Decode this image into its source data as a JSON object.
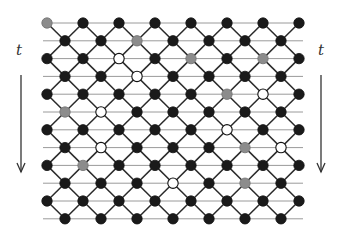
{
  "diagram": {
    "time_label": "t",
    "colors": {
      "black": "#1a1a1a",
      "gray": "#8c8c8c",
      "white": "#ffffff",
      "edge": "#2a2a2a",
      "hline": "#9a9a9a",
      "arrow": "#333333"
    },
    "grid": {
      "x0": 47,
      "y0": 23,
      "dx": 36,
      "dy": 17.8,
      "radius": 5.2
    },
    "rows": [
      "GBBBBBBB",
      "BBGBBBB",
      "BBWBGBGB",
      "BBWBBBB",
      "BBBBBGWB",
      "GWBBBBB",
      "BBBBBWBB",
      "BWBBBGW",
      "BGBBBBBB",
      "BBBWBGB",
      "BBBBBBBB",
      "BBBBBBB"
    ],
    "left_arrow": {
      "label_x": 16,
      "label_y": 56,
      "x": 21,
      "y1": 75,
      "y2": 172
    },
    "right_arrow": {
      "label_x": 318,
      "label_y": 56,
      "x": 321,
      "y1": 75,
      "y2": 172
    }
  }
}
